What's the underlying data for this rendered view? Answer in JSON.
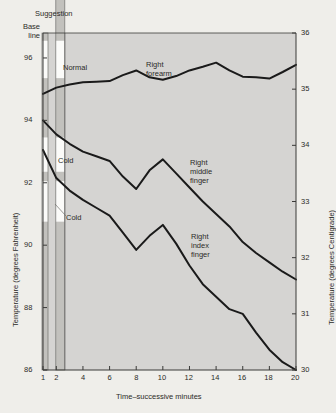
{
  "figure": {
    "bg_color": "#efeeea",
    "plot_bg_color": "#d5d4d2",
    "line_color": "#1a1a1a",
    "axis_color": "#3a3a38",
    "bar_fill_color": "#c2c1bd",
    "bar_white_color": "#fbfbf9"
  },
  "axes": {
    "left_title": "Temperature (degrees Fahrenheit)",
    "right_title": "Temperature (degrees Centigrade)",
    "x_title": "Time–successive minutes",
    "left_ticks": [
      "96",
      "94",
      "92",
      "90",
      "88",
      "86"
    ],
    "right_ticks": [
      "36",
      "35",
      "34",
      "33",
      "32",
      "31",
      "30"
    ],
    "x_ticks": [
      "1",
      "2",
      "4",
      "6",
      "8",
      "10",
      "12",
      "14",
      "16",
      "18",
      "20"
    ]
  },
  "annotations": {
    "suggestion": "Suggestion",
    "base_line": "Base\nline",
    "normal": "Normal",
    "cold_upper": "Cold",
    "cold_lower": "Cold",
    "forearm": "Right\nforearm",
    "middle_finger": "Right\nmiddle\nfinger",
    "index_finger": "Right\nindex\nfinger"
  },
  "chart_data": {
    "type": "line",
    "title": "",
    "xlabel": "Time–successive minutes",
    "ylabel": "Temperature (degrees Fahrenheit)",
    "ylabel_secondary": "Temperature (degrees Centigrade)",
    "xlim": [
      1,
      20
    ],
    "ylim": [
      86,
      96.8
    ],
    "ylim_secondary": [
      30,
      36
    ],
    "grid": false,
    "legend": "inline-annotations",
    "x": [
      1,
      2,
      3,
      4,
      5,
      6,
      7,
      8,
      9,
      10,
      11,
      12,
      13,
      14,
      15,
      16,
      17,
      18,
      19,
      20
    ],
    "series": [
      {
        "name": "Right forearm",
        "values": [
          94.85,
          95.05,
          95.15,
          95.22,
          95.24,
          95.26,
          95.45,
          95.6,
          95.38,
          95.3,
          95.42,
          95.6,
          95.72,
          95.85,
          95.6,
          95.4,
          95.38,
          95.34,
          95.55,
          95.78
        ]
      },
      {
        "name": "Right middle finger",
        "values": [
          94.0,
          93.55,
          93.25,
          93.0,
          92.85,
          92.7,
          92.2,
          91.8,
          92.4,
          92.75,
          92.3,
          91.85,
          91.4,
          91.0,
          90.6,
          90.1,
          89.75,
          89.45,
          89.15,
          88.9
        ]
      },
      {
        "name": "Right index finger",
        "values": [
          93.05,
          92.15,
          91.75,
          91.45,
          91.2,
          90.95,
          90.4,
          89.85,
          90.3,
          90.65,
          90.05,
          89.35,
          88.75,
          88.35,
          87.95,
          87.8,
          87.2,
          86.65,
          86.25,
          86.0
        ]
      }
    ],
    "condition_bars": [
      {
        "name": "base-line-bar",
        "x_minute": 1,
        "label": "Base line",
        "segments": [
          {
            "from": 96.8,
            "to": 96.55,
            "fill": "gray"
          },
          {
            "from": 96.55,
            "to": 95.35,
            "fill": "white"
          },
          {
            "from": 95.35,
            "to": 93.45,
            "fill": "gray"
          },
          {
            "from": 93.45,
            "to": 92.35,
            "fill": "white"
          },
          {
            "from": 92.35,
            "to": 92.05,
            "fill": "gray"
          },
          {
            "from": 92.05,
            "to": 90.75,
            "fill": "white"
          },
          {
            "from": 90.75,
            "to": 86.0,
            "fill": "gray"
          }
        ]
      },
      {
        "name": "suggestion-bar",
        "x_minute": 2,
        "label": "Suggestion",
        "segments": [
          {
            "from": 98.4,
            "to": 96.55,
            "fill": "gray"
          },
          {
            "from": 96.55,
            "to": 95.35,
            "fill": "white"
          },
          {
            "from": 95.35,
            "to": 93.45,
            "fill": "gray"
          },
          {
            "from": 93.45,
            "to": 92.35,
            "fill": "white"
          },
          {
            "from": 92.35,
            "to": 92.05,
            "fill": "gray"
          },
          {
            "from": 92.05,
            "to": 90.75,
            "fill": "white"
          },
          {
            "from": 90.75,
            "to": 86.0,
            "fill": "gray"
          }
        ]
      }
    ]
  }
}
